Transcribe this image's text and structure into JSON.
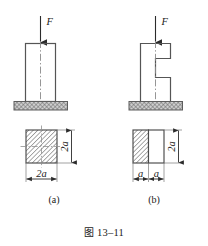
{
  "figure": {
    "caption_prefix": "图",
    "caption_number": "13–11",
    "caption_full": "图 13–11",
    "type": "engineering-mechanics-diagram"
  },
  "panels": [
    {
      "id": "a",
      "label": "(a)",
      "load_label": "F",
      "elevation": {
        "description": "solid rectangular column on hatched ground base, centered downward load F",
        "centerline": "dash-dot"
      },
      "section": {
        "description": "fully hatched square cross-section",
        "hatched_fraction": "full",
        "dim_horizontal": "2a",
        "dim_vertical": "2a"
      }
    },
    {
      "id": "b",
      "label": "(b)",
      "load_label": "F",
      "elevation": {
        "description": "E-shaped notched column on hatched ground base, centered downward load F",
        "centerline": "dash-dot"
      },
      "section": {
        "description": "left half hatched, right half unhatched rectangular cross-section",
        "hatched_fraction": "left-half",
        "dim_horizontal_left": "a",
        "dim_horizontal_right": "a",
        "dim_vertical": "2a"
      }
    }
  ],
  "colors": {
    "line": "#3a3a3a",
    "hatch": "#6d6d6d",
    "ground_fill": "#bdbdbd",
    "text": "#1a1a1a",
    "paper": "#ffffff"
  }
}
